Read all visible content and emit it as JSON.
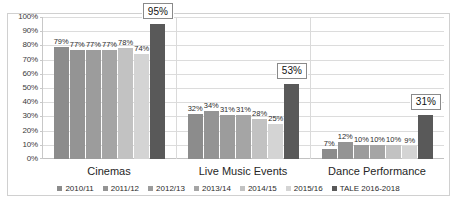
{
  "chart_data": {
    "type": "bar",
    "title": "",
    "xlabel": "",
    "ylabel": "",
    "ylim": [
      0,
      100
    ],
    "grid": true,
    "legend_position": "bottom",
    "categories": [
      "Cinemas",
      "Live Music Events",
      "Dance Performance"
    ],
    "ytick_labels": [
      "100%",
      "90%",
      "80%",
      "70%",
      "60%",
      "50%",
      "40%",
      "30%",
      "20%",
      "10%",
      "0%"
    ],
    "ytick_values": [
      100,
      90,
      80,
      70,
      60,
      50,
      40,
      30,
      20,
      10,
      0
    ],
    "series": [
      {
        "name": "2010/11",
        "color": "#8c8c8c",
        "values": [
          79,
          32,
          7
        ],
        "labels": [
          "79%",
          "32%",
          "7%"
        ]
      },
      {
        "name": "2011/12",
        "color": "#949494",
        "values": [
          77,
          34,
          12
        ],
        "labels": [
          "77%",
          "34%",
          "12%"
        ]
      },
      {
        "name": "2012/13",
        "color": "#9c9c9c",
        "values": [
          77,
          31,
          10
        ],
        "labels": [
          "77%",
          "31%",
          "10%"
        ]
      },
      {
        "name": "2013/14",
        "color": "#a5a5a5",
        "values": [
          77,
          31,
          10
        ],
        "labels": [
          "77%",
          "31%",
          "10%"
        ]
      },
      {
        "name": "2014/15",
        "color": "#c2c2c2",
        "values": [
          78,
          28,
          10
        ],
        "labels": [
          "78%",
          "28%",
          "10%"
        ]
      },
      {
        "name": "2015/16",
        "color": "#d4d4d4",
        "values": [
          74,
          25,
          9
        ],
        "labels": [
          "74%",
          "25%",
          "9%"
        ]
      },
      {
        "name": "TALE 2016-2018",
        "color": "#595959",
        "values": [
          95,
          53,
          31
        ],
        "labels": [
          "95%",
          "53%",
          "31%"
        ],
        "highlight": true
      }
    ]
  },
  "axis": {
    "y_max": 100,
    "y_min": 0
  }
}
